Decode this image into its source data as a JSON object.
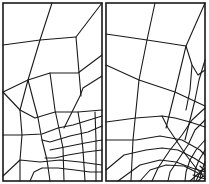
{
  "figure": {
    "line_color": "#1a1a1a",
    "background": "#ffffff",
    "panels": [
      {
        "name": "left-mesh",
        "border": [
          3,
          3,
          99,
          178
        ],
        "lines": [
          [
            [
              52,
              3
            ],
            [
              40,
              40
            ],
            [
              28,
              80
            ],
            [
              20,
              110
            ]
          ],
          [
            [
              3,
              45
            ],
            [
              40,
              40
            ],
            [
              76,
              37
            ]
          ],
          [
            [
              102,
              3
            ],
            [
              76,
              37
            ],
            [
              81,
              96
            ]
          ],
          [
            [
              102,
              55
            ],
            [
              78,
              73
            ],
            [
              50,
              73
            ],
            [
              28,
              80
            ],
            [
              3,
              92
            ]
          ],
          [
            [
              102,
              76
            ],
            [
              83,
              88
            ],
            [
              80,
              96
            ],
            [
              64,
              128
            ]
          ],
          [
            [
              50,
              73
            ],
            [
              55,
              110
            ],
            [
              58,
              124
            ],
            [
              63,
              148
            ],
            [
              64,
              181
            ]
          ],
          [
            [
              28,
              80
            ],
            [
              38,
              118
            ],
            [
              42,
              140
            ],
            [
              47,
              160
            ],
            [
              50,
              181
            ]
          ],
          [
            [
              20,
              110
            ],
            [
              22,
              135
            ],
            [
              20,
              160
            ],
            [
              20,
              181
            ]
          ],
          [
            [
              3,
              92
            ],
            [
              20,
              110
            ],
            [
              35,
              118
            ],
            [
              55,
              112
            ],
            [
              78,
              112
            ],
            [
              102,
              110
            ]
          ],
          [
            [
              3,
              135
            ],
            [
              22,
              135
            ],
            [
              42,
              134
            ],
            [
              58,
              128
            ],
            [
              73,
              125
            ],
            [
              102,
              116
            ]
          ],
          [
            [
              102,
              126
            ],
            [
              88,
              132
            ],
            [
              70,
              136
            ],
            [
              50,
              142
            ],
            [
              42,
              140
            ]
          ],
          [
            [
              102,
              140
            ],
            [
              85,
              143
            ],
            [
              70,
              146
            ],
            [
              60,
              148
            ],
            [
              50,
              150
            ]
          ],
          [
            [
              102,
              150
            ],
            [
              86,
              152
            ],
            [
              68,
              155
            ],
            [
              55,
              158
            ],
            [
              45,
              158
            ]
          ],
          [
            [
              3,
              176
            ],
            [
              20,
              160
            ],
            [
              40,
              162
            ],
            [
              60,
              160
            ],
            [
              80,
              162
            ],
            [
              102,
              165
            ]
          ],
          [
            [
              30,
              181
            ],
            [
              34,
              172
            ],
            [
              42,
              168
            ],
            [
              58,
              168
            ],
            [
              75,
              170
            ],
            [
              90,
              172
            ],
            [
              102,
              172
            ]
          ],
          [
            [
              78,
              112
            ],
            [
              81,
              130
            ],
            [
              83,
              150
            ],
            [
              85,
              181
            ]
          ],
          [
            [
              95,
              112
            ],
            [
              96,
              140
            ],
            [
              96,
              181
            ]
          ]
        ]
      },
      {
        "name": "right-mesh",
        "border": [
          106,
          3,
          99,
          178
        ],
        "lines": [
          [
            [
              155,
              3
            ],
            [
              147,
              40
            ],
            [
              139,
              80
            ],
            [
              136,
              110
            ],
            [
              133,
              140
            ],
            [
              131,
              181
            ]
          ],
          [
            [
              106,
              34
            ],
            [
              147,
              40
            ],
            [
              186,
              46
            ]
          ],
          [
            [
              205,
              3
            ],
            [
              186,
              46
            ],
            [
              192,
              65
            ],
            [
              198,
              75
            ],
            [
              205,
              70
            ]
          ],
          [
            [
              192,
              65
            ],
            [
              190,
              90
            ],
            [
              186,
              110
            ]
          ],
          [
            [
              106,
              65
            ],
            [
              139,
              80
            ],
            [
              175,
              92
            ],
            [
              205,
              106
            ]
          ],
          [
            [
              186,
              46
            ],
            [
              175,
              92
            ],
            [
              166,
              128
            ]
          ],
          [
            [
              205,
              60
            ],
            [
              199,
              80
            ],
            [
              195,
              100
            ],
            [
              190,
              120
            ],
            [
              185,
              140
            ]
          ],
          [
            [
              106,
              122
            ],
            [
              136,
              118
            ],
            [
              162,
              116
            ],
            [
              175,
              118
            ],
            [
              190,
              122
            ],
            [
              205,
              127
            ]
          ],
          [
            [
              162,
              116
            ],
            [
              168,
              128
            ],
            [
              176,
              140
            ],
            [
              186,
              155
            ],
            [
              196,
              168
            ],
            [
              205,
              178
            ]
          ],
          [
            [
              106,
              170
            ],
            [
              124,
              155
            ],
            [
              146,
              150
            ],
            [
              162,
              148
            ],
            [
              178,
              150
            ],
            [
              194,
              158
            ],
            [
              205,
              165
            ]
          ],
          [
            [
              118,
              181
            ],
            [
              140,
              165
            ],
            [
              160,
              160
            ],
            [
              176,
              162
            ],
            [
              192,
              168
            ],
            [
              205,
              172
            ]
          ],
          [
            [
              140,
              181
            ],
            [
              150,
              170
            ],
            [
              166,
              165
            ],
            [
              184,
              166
            ],
            [
              200,
              174
            ]
          ],
          [
            [
              106,
              140
            ],
            [
              136,
              140
            ],
            [
              160,
              136
            ],
            [
              182,
              140
            ],
            [
              200,
              150
            ],
            [
              205,
              155
            ]
          ],
          [
            [
              205,
              140
            ],
            [
              196,
              150
            ],
            [
              190,
              160
            ],
            [
              186,
              172
            ],
            [
              185,
              181
            ]
          ],
          [
            [
              205,
              150
            ],
            [
              199,
              160
            ],
            [
              195,
              170
            ],
            [
              194,
              181
            ]
          ],
          [
            [
              205,
              120
            ],
            [
              195,
              130
            ],
            [
              188,
              145
            ],
            [
              178,
              160
            ],
            [
              170,
              172
            ],
            [
              168,
              181
            ]
          ],
          [
            [
              205,
              108
            ],
            [
              192,
              120
            ],
            [
              182,
              135
            ],
            [
              170,
              150
            ],
            [
              158,
              168
            ],
            [
              152,
              181
            ]
          ],
          [
            [
              205,
              162
            ],
            [
              202,
              170
            ],
            [
              200,
              178
            ]
          ],
          [
            [
              196,
              181
            ],
            [
              200,
              172
            ],
            [
              205,
              168
            ]
          ],
          [
            [
              190,
              181
            ],
            [
              198,
              174
            ],
            [
              205,
              174
            ]
          ],
          [
            [
              198,
              181
            ],
            [
              203,
              176
            ],
            [
              205,
              176
            ]
          ],
          [
            [
              193,
              175
            ],
            [
              205,
              179
            ]
          ],
          [
            [
              200,
              166
            ],
            [
              205,
              171
            ]
          ]
        ]
      }
    ]
  }
}
